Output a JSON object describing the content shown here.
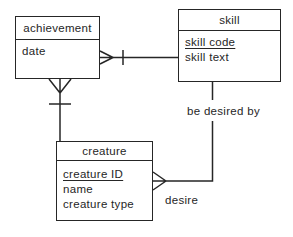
{
  "diagram_type": "entity-relationship",
  "entities": [
    {
      "name": "achievement",
      "attributes": [
        {
          "label": "date",
          "key": false
        }
      ]
    },
    {
      "name": "skill",
      "attributes": [
        {
          "label": "skill code",
          "key": true
        },
        {
          "label": "skill text",
          "key": false
        }
      ]
    },
    {
      "name": "creature",
      "attributes": [
        {
          "label": "creature ID",
          "key": true
        },
        {
          "label": "name",
          "key": false
        },
        {
          "label": "creature type",
          "key": false
        }
      ]
    }
  ],
  "relationships": [
    {
      "label": "be desired by",
      "from": "skill",
      "to": "creature"
    },
    {
      "label": "desire",
      "from": "creature",
      "to": "skill"
    }
  ],
  "connections": [
    {
      "between": [
        "achievement",
        "skill"
      ],
      "label": "",
      "notation": "crows-foot-many at achievement side, single bar toward skill"
    },
    {
      "between": [
        "achievement",
        "creature"
      ],
      "label": "",
      "notation": "crows-foot-many at achievement bottom, single bar toward creature"
    },
    {
      "between": [
        "skill",
        "creature"
      ],
      "label": "be desired by / desire",
      "notation": "crows-foot-many at creature side"
    }
  ],
  "colors": {
    "line": "#262626",
    "text": "#262626",
    "background": "#ffffff"
  }
}
